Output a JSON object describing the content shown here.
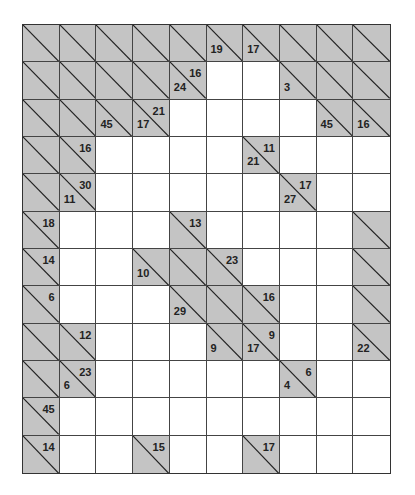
{
  "puzzle": {
    "type": "kakuro",
    "rows": 12,
    "cols": 10,
    "colors": {
      "clue_bg": "#c4c4c4",
      "white_bg": "#ffffff",
      "line": "#333333"
    },
    "legend": "Each row is a string of cell codes: X = blocked clue cell, . = empty white cell; clues listed separately as [row, col, down, right]",
    "grid": [
      "XXXXXXXXXX",
      "XXXXX..XXX",
      "XXXX....XX",
      "XX....X...",
      "XX.....X..",
      "X...X....X",
      "X..XXX...X",
      "X...XXX..X",
      "XX...XX..X",
      "XX.....X..",
      "X.........",
      "X..X..X..."
    ],
    "clues": [
      {
        "r": 0,
        "c": 5,
        "down": "19",
        "right": ""
      },
      {
        "r": 0,
        "c": 6,
        "down": "17",
        "right": ""
      },
      {
        "r": 1,
        "c": 4,
        "down": "24",
        "right": "16"
      },
      {
        "r": 1,
        "c": 7,
        "down": "3",
        "right": ""
      },
      {
        "r": 2,
        "c": 2,
        "down": "45",
        "right": ""
      },
      {
        "r": 2,
        "c": 3,
        "down": "17",
        "right": "21"
      },
      {
        "r": 2,
        "c": 8,
        "down": "45",
        "right": ""
      },
      {
        "r": 2,
        "c": 9,
        "down": "16",
        "right": ""
      },
      {
        "r": 3,
        "c": 1,
        "down": "",
        "right": "16"
      },
      {
        "r": 3,
        "c": 6,
        "down": "21",
        "right": "11"
      },
      {
        "r": 4,
        "c": 1,
        "down": "11",
        "right": "30"
      },
      {
        "r": 4,
        "c": 7,
        "down": "27",
        "right": "17"
      },
      {
        "r": 5,
        "c": 0,
        "down": "",
        "right": "18"
      },
      {
        "r": 5,
        "c": 4,
        "down": "",
        "right": "13"
      },
      {
        "r": 6,
        "c": 0,
        "down": "",
        "right": "14"
      },
      {
        "r": 6,
        "c": 3,
        "down": "10",
        "right": ""
      },
      {
        "r": 6,
        "c": 5,
        "down": "",
        "right": "23"
      },
      {
        "r": 7,
        "c": 0,
        "down": "",
        "right": "6"
      },
      {
        "r": 7,
        "c": 4,
        "down": "29",
        "right": ""
      },
      {
        "r": 7,
        "c": 6,
        "down": "",
        "right": "16"
      },
      {
        "r": 8,
        "c": 1,
        "down": "",
        "right": "12"
      },
      {
        "r": 8,
        "c": 5,
        "down": "9",
        "right": ""
      },
      {
        "r": 8,
        "c": 6,
        "down": "17",
        "right": "9"
      },
      {
        "r": 8,
        "c": 9,
        "down": "22",
        "right": ""
      },
      {
        "r": 9,
        "c": 1,
        "down": "6",
        "right": "23"
      },
      {
        "r": 9,
        "c": 7,
        "down": "4",
        "right": "6"
      },
      {
        "r": 10,
        "c": 0,
        "down": "",
        "right": "45"
      },
      {
        "r": 11,
        "c": 0,
        "down": "",
        "right": "14"
      },
      {
        "r": 11,
        "c": 3,
        "down": "",
        "right": "15"
      },
      {
        "r": 11,
        "c": 6,
        "down": "",
        "right": "17"
      }
    ]
  }
}
